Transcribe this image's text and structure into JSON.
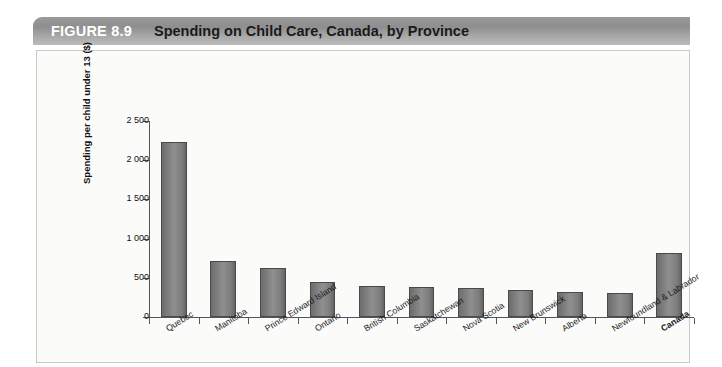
{
  "figure": {
    "number_label": "FIGURE 8.9",
    "title": "Spending on Child Care, Canada, by Province"
  },
  "chart_data": {
    "type": "bar",
    "title": "Spending on Child Care, Canada, by Province",
    "xlabel": "",
    "ylabel": "Spending per child under 13 ($)",
    "ylim": [
      0,
      2500
    ],
    "yticks": [
      0,
      500,
      1000,
      1500,
      2000,
      2500
    ],
    "ytick_labels": [
      "0",
      "500",
      "1 000",
      "1 500",
      "2 000",
      "2 500"
    ],
    "grid": false,
    "legend": "none",
    "categories": [
      "Quebec",
      "Manitoba",
      "Prince Edward Island",
      "Ontario",
      "British Columbia",
      "Saskatchewan",
      "Nova Scotia",
      "New Brunswick",
      "Alberta",
      "Newfoundland & Labrador",
      "Canada"
    ],
    "values": [
      2230,
      710,
      630,
      450,
      390,
      385,
      365,
      345,
      325,
      310,
      820
    ],
    "emphasized_categories": [
      "Canada"
    ],
    "bar_color": "#808080",
    "bar_edge_color": "#4a4a4a"
  },
  "colors": {
    "title_bar_start": "#9a9a9a",
    "title_bar_end": "#bcbcbc",
    "figure_number_text": "#ffffff",
    "title_text": "#1a1a1a",
    "panel_background": "#fbfbfa",
    "panel_border": "#c9c9c9",
    "axis": "#555555"
  }
}
